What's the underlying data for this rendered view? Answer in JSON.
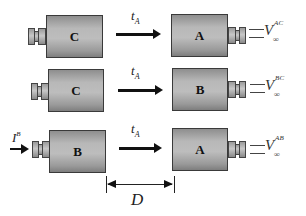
{
  "diagram": {
    "rows": [
      {
        "left_cylinder": {
          "label": "C"
        },
        "transfer_label": {
          "main": "t",
          "sub": "A"
        },
        "right_cylinder": {
          "label": "A"
        },
        "output_label": {
          "main": "V",
          "sub": "∞",
          "sup": "AC"
        }
      },
      {
        "left_cylinder": {
          "label": "C"
        },
        "transfer_label": {
          "main": "t",
          "sub": "A"
        },
        "right_cylinder": {
          "label": "B"
        },
        "output_label": {
          "main": "V",
          "sub": "∞",
          "sup": "BC"
        }
      },
      {
        "input_label": {
          "main": "I",
          "sup": "B"
        },
        "left_cylinder": {
          "label": "B"
        },
        "transfer_label": {
          "main": "t",
          "sub": "A"
        },
        "right_cylinder": {
          "label": "A"
        },
        "output_label": {
          "main": "V",
          "sub": "∞",
          "sup": "AB"
        }
      }
    ],
    "dimension": {
      "label": "D"
    }
  }
}
